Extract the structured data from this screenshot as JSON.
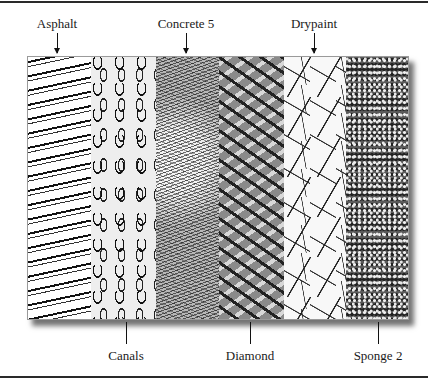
{
  "figure": {
    "top_labels": [
      {
        "text": "Asphalt",
        "x": 57
      },
      {
        "text": "Concrete 5",
        "x": 186
      },
      {
        "text": "Drypaint",
        "x": 314
      }
    ],
    "bottom_labels": [
      {
        "text": "Canals",
        "x": 126
      },
      {
        "text": "Diamond",
        "x": 250
      },
      {
        "text": "Sponge 2",
        "x": 378
      }
    ],
    "strips": [
      {
        "name": "Asphalt",
        "texture": "asphalt"
      },
      {
        "name": "Canals",
        "texture": "canals"
      },
      {
        "name": "Concrete 5",
        "texture": "concrete"
      },
      {
        "name": "Diamond",
        "texture": "diamond"
      },
      {
        "name": "Drypaint",
        "texture": "drypaint"
      },
      {
        "name": "Sponge 2",
        "texture": "sponge"
      }
    ]
  }
}
